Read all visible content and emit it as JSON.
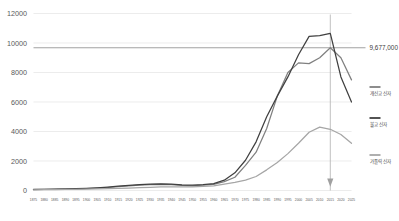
{
  "chart_data": {
    "type": "line",
    "title": "",
    "xlabel": "",
    "ylabel": "",
    "ylim": [
      0,
      12000
    ],
    "yticks": [
      0,
      2000,
      4000,
      6000,
      8000,
      10000,
      12000
    ],
    "ytick_labels": [
      "0",
      "2000",
      "4000",
      "6000",
      "8000",
      "10000",
      "12000"
    ],
    "grid": true,
    "legend_position": "right",
    "categories": [
      "1875",
      "1880",
      "1885",
      "1890",
      "1895",
      "1900",
      "1905",
      "1910",
      "1915",
      "1920",
      "1925",
      "1930",
      "1935",
      "1940",
      "1945",
      "1950",
      "1955",
      "1960",
      "1965",
      "1970",
      "1975",
      "1980",
      "1985",
      "1990",
      "1995",
      "2000",
      "2005",
      "2010",
      "2015",
      "2020",
      "2025"
    ],
    "series": [
      {
        "name": "개신교 신자",
        "color": "#808080",
        "values": [
          60,
          70,
          80,
          95,
          110,
          130,
          160,
          200,
          260,
          320,
          360,
          400,
          420,
          400,
          340,
          320,
          360,
          420,
          600,
          900,
          1700,
          2600,
          4200,
          6400,
          8000,
          8650,
          8600,
          9000,
          9677,
          9000,
          7500
        ]
      },
      {
        "name": "불교 신자",
        "color": "#404040",
        "values": [
          70,
          80,
          95,
          110,
          125,
          150,
          185,
          230,
          290,
          350,
          395,
          430,
          450,
          430,
          380,
          360,
          400,
          470,
          700,
          1200,
          2050,
          3300,
          5000,
          6400,
          7700,
          9200,
          10450,
          10500,
          10650,
          7700,
          6000
        ]
      },
      {
        "name": "가톨릭 신자",
        "color": "#a6a6a6",
        "values": [
          50,
          55,
          62,
          70,
          80,
          92,
          105,
          120,
          140,
          165,
          190,
          215,
          240,
          250,
          240,
          250,
          280,
          320,
          430,
          550,
          700,
          950,
          1400,
          1900,
          2500,
          3200,
          3950,
          4300,
          4150,
          3800,
          3200
        ]
      }
    ],
    "reference_line": {
      "value": 9677,
      "label": "9,677,000",
      "color": "#8a8a8a"
    },
    "marker": {
      "category": "2015",
      "type": "down-arrow",
      "color": "#a0a0a0"
    }
  }
}
